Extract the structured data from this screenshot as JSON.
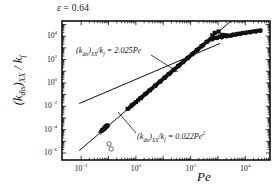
{
  "figure": {
    "title": "",
    "epsilon_annotation": "ε = 0.64",
    "epsilon_symbol": "ε",
    "epsilon_value": "0.64"
  },
  "axes": {
    "x": {
      "label": "Pe",
      "scale": "log",
      "ticks": [
        "10⁻²",
        "10⁰",
        "10²",
        "10⁴"
      ],
      "tick_exponents": [
        -2,
        0,
        2,
        4
      ],
      "tick_mantissa": "10",
      "range_exponents": [
        -2.7,
        4.9
      ]
    },
    "y": {
      "label": "(k_dis)_xx / k_f",
      "label_parts": {
        "open": "(",
        "k": "k",
        "sub_dis": "dis",
        "close": ")",
        "sub_xx": "XX",
        "slash": " / ",
        "k2": "k",
        "sub_f": "f"
      },
      "scale": "log",
      "ticks": [
        "10⁴",
        "10²",
        "10⁰",
        "10⁻²",
        "10⁻⁴",
        "10⁻⁶"
      ],
      "tick_exponents": [
        4,
        2,
        0,
        -2,
        -4,
        -6
      ],
      "tick_mantissa": "10",
      "range_exponents": [
        -6.6,
        5.3
      ]
    }
  },
  "annotations": [
    {
      "name": "linear-fit-equation",
      "text": "(k_dis)_xx/k_f = 2.025Pe",
      "coefficient": "2.025",
      "variable": "Pe",
      "exponent": "1"
    },
    {
      "name": "quadratic-fit-equation",
      "text": "(k_dis)_xx/k_f = 0.022Pe²",
      "coefficient": "0.022",
      "variable": "Pe",
      "exponent": "2"
    }
  ],
  "chart_data": {
    "type": "scatter",
    "title": "",
    "xlabel": "Pe",
    "ylabel": "(k_dis)_xx / k_f",
    "xscale": "log",
    "yscale": "log",
    "xlim": [
      0.002,
      79432.0
    ],
    "ylim": [
      2.5e-07,
      200000.0
    ],
    "grid": false,
    "legend": "none",
    "annotation_epsilon": "ε = 0.64",
    "fit_lines": [
      {
        "name": "linear-fit",
        "label": "(k_dis)_xx/k_f = 2.025Pe",
        "coefficient": 2.025,
        "power": 1,
        "x_start": 0.0085,
        "x_end": 1200.0,
        "y_start": 0.0172,
        "y_end": 2430.0
      },
      {
        "name": "quadratic-fit",
        "label": "(k_dis)_xx/k_f = 0.022Pe²",
        "coefficient": 0.022,
        "power": 2,
        "x_start": 0.0085,
        "x_end": 50000.0,
        "y_start": 1.59e-06,
        "y_end": 55000000.0
      }
    ],
    "series": [
      {
        "name": "dataset-squares",
        "marker": "filled-square",
        "points": [
          [
            0.06,
            9.5e-05
          ],
          [
            0.07,
            0.00013
          ],
          [
            0.075,
            0.00015
          ],
          [
            0.08,
            0.00018
          ],
          [
            0.085,
            0.0002
          ],
          [
            0.09,
            0.00023
          ],
          [
            0.5,
            0.006
          ],
          [
            0.7,
            0.012
          ],
          [
            1.0,
            0.023
          ],
          [
            1.5,
            0.05
          ],
          [
            2.2,
            0.11
          ],
          [
            3.2,
            0.23
          ],
          [
            5.0,
            0.56
          ],
          [
            7.5,
            1.25
          ],
          [
            11.0,
            2.7
          ],
          [
            16.0,
            5.7
          ],
          [
            24.0,
            12.8
          ],
          [
            35.0,
            27.0
          ],
          [
            52.0,
            60.0
          ],
          [
            78.0,
            134.0
          ],
          [
            115.0,
            290.0
          ],
          [
            170.0,
            640.0
          ],
          [
            250.0,
            1380.0
          ],
          [
            380.0,
            3200.0
          ],
          [
            560.0,
            5600.0
          ],
          [
            830.0,
            7200.0
          ],
          [
            1200.0,
            9500.0
          ],
          [
            1800.0,
            12000.0
          ],
          [
            2600.0,
            11000.0
          ],
          [
            3800.0,
            13500.0
          ],
          [
            5600.0,
            16000.0
          ],
          [
            9000.0,
            19000.0
          ],
          [
            14000.0,
            22000.0
          ],
          [
            22000.0,
            26000.0
          ],
          [
            34000.0,
            30000.0
          ]
        ]
      },
      {
        "name": "dataset-diamonds",
        "marker": "filled-diamond",
        "points": [
          [
            0.055,
            7.5e-05
          ],
          [
            0.065,
            0.0001
          ],
          [
            0.072,
            0.000125
          ],
          [
            0.6,
            0.008
          ],
          [
            0.9,
            0.019
          ],
          [
            1.3,
            0.04
          ],
          [
            1.9,
            0.08
          ],
          [
            2.8,
            0.18
          ],
          [
            4.2,
            0.39
          ],
          [
            6.2,
            0.86
          ],
          [
            9.2,
            1.9
          ],
          [
            13.5,
            4.1
          ],
          [
            20.0,
            9.0
          ],
          [
            30.0,
            20.0
          ],
          [
            44.0,
            43.0
          ],
          [
            65.0,
            95.0
          ],
          [
            96.0,
            205.0
          ],
          [
            142.0,
            445.0
          ],
          [
            210.0,
            970.0
          ],
          [
            310.0,
            2100.0
          ],
          [
            460.0,
            4300.0
          ],
          [
            680.0,
            6100.0
          ],
          [
            1000.0,
            7600.0
          ],
          [
            1500.0,
            8900.0
          ],
          [
            2200.0,
            10500.0
          ],
          [
            3300.0,
            12500.0
          ],
          [
            4900.0,
            14500.0
          ],
          [
            7300.0,
            17000.0
          ],
          [
            11000.0,
            20000.0
          ],
          [
            17000.0,
            23500.0
          ],
          [
            26000.0,
            27500.0
          ]
        ]
      },
      {
        "name": "dataset-circles",
        "marker": "filled-circle",
        "points": [
          [
            0.058,
            8.5e-05
          ],
          [
            0.068,
            0.00011
          ],
          [
            0.8,
            0.015
          ],
          [
            1.2,
            0.033
          ],
          [
            1.7,
            0.065
          ],
          [
            2.5,
            0.14
          ],
          [
            3.7,
            0.31
          ],
          [
            5.5,
            0.68
          ],
          [
            8.2,
            1.5
          ],
          [
            12.0,
            3.2
          ],
          [
            18.0,
            7.2
          ],
          [
            27.0,
            16.0
          ],
          [
            40.0,
            36.0
          ],
          [
            59.0,
            78.0
          ],
          [
            87.0,
            170.0
          ],
          [
            128.0,
            365.0
          ],
          [
            190.0,
            790.0
          ],
          [
            280.0,
            1700.0
          ],
          [
            415.0,
            3600.0
          ],
          [
            610.0,
            5400.0
          ],
          [
            900.0,
            6900.0
          ],
          [
            1350.0,
            8200.0
          ],
          [
            2000.0,
            9800.0
          ],
          [
            3000.0,
            11500.0
          ],
          [
            4400.0,
            13800.0
          ],
          [
            6600.0,
            16200.0
          ],
          [
            10000.0,
            19000.0
          ],
          [
            15500.0,
            22500.0
          ],
          [
            24000.0,
            26500.0
          ],
          [
            36000.0,
            31000.0
          ]
        ]
      },
      {
        "name": "dataset-crosses",
        "marker": "cross",
        "points": [
          [
            0.05,
            6e-05
          ],
          [
            0.062,
            9e-05
          ],
          [
            0.078,
            0.00014
          ],
          [
            0.088,
            0.00019
          ],
          [
            0.095,
            0.00022
          ],
          [
            0.55,
            0.007
          ],
          [
            0.75,
            0.013
          ],
          [
            1.1,
            0.027
          ],
          [
            1.6,
            0.056
          ],
          [
            2.4,
            0.125
          ],
          [
            3.5,
            0.27
          ],
          [
            5.2,
            0.6
          ],
          [
            7.8,
            1.35
          ],
          [
            11.5,
            2.9
          ],
          [
            17.0,
            6.4
          ],
          [
            25.0,
            14.0
          ],
          [
            37.0,
            30.0
          ],
          [
            55.0,
            66.0
          ],
          [
            81.0,
            145.0
          ],
          [
            120.0,
            315.0
          ],
          [
            178.0,
            680.0
          ]
        ]
      },
      {
        "name": "dataset-outliers-low",
        "marker": "open-circle",
        "points": [
          [
            0.105,
            6e-06
          ],
          [
            0.125,
            2.2e-06
          ]
        ]
      },
      {
        "name": "dataset-upper-squares",
        "marker": "filled-square",
        "points": [
          [
            760.0,
            19000.0
          ],
          [
            1050.0,
            25000.0
          ],
          [
            1450.0,
            13000.0
          ],
          [
            620.0,
            11500.0
          ]
        ]
      }
    ]
  }
}
